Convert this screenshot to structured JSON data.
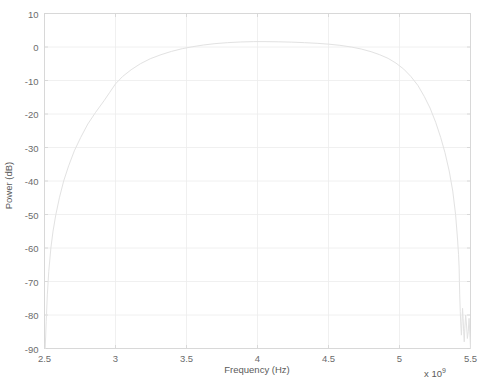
{
  "chart_data": {
    "type": "line",
    "title": "",
    "xlabel": "Frequency (Hz)",
    "ylabel": "Power (dB)",
    "x_exponent_prefix": "x 10",
    "x_exponent_value": "9",
    "xlim": [
      2.5,
      5.5
    ],
    "ylim": [
      -90,
      10
    ],
    "xticks": [
      2.5,
      3,
      3.5,
      4,
      4.5,
      5,
      5.5
    ],
    "xtick_labels": [
      "2.5",
      "3",
      "3.5",
      "4",
      "4.5",
      "5",
      "5.5"
    ],
    "yticks": [
      10,
      0,
      -10,
      -20,
      -30,
      -40,
      -50,
      -60,
      -70,
      -80,
      -90
    ],
    "ytick_labels": [
      "10",
      "0",
      "-10",
      "-20",
      "-30",
      "-40",
      "-50",
      "-60",
      "-70",
      "-80",
      "-90"
    ],
    "grid": true,
    "legend": null,
    "line_color": "#e2e2e2",
    "grid_color": "#ececec",
    "axis_color": "#d6d6d6",
    "background_color": "#ffffff",
    "series": [
      {
        "name": "power-spectrum",
        "x": [
          2.505,
          2.512,
          2.52,
          2.53,
          2.545,
          2.56,
          2.58,
          2.605,
          2.635,
          2.67,
          2.71,
          2.755,
          2.805,
          2.86,
          2.92,
          2.96,
          3.0,
          3.05,
          3.11,
          3.175,
          3.245,
          3.32,
          3.395,
          3.47,
          3.545,
          3.62,
          3.7,
          3.79,
          3.88,
          3.97,
          4.06,
          4.15,
          4.24,
          4.33,
          4.42,
          4.5,
          4.58,
          4.66,
          4.73,
          4.8,
          4.86,
          4.92,
          4.975,
          5.03,
          5.08,
          5.13,
          5.175,
          5.215,
          5.255,
          5.29,
          5.32,
          5.35,
          5.375,
          5.395,
          5.408,
          5.416,
          5.42,
          5.422,
          5.424,
          5.428,
          5.432,
          5.436,
          5.44,
          5.444,
          5.448,
          5.452,
          5.456,
          5.46,
          5.466,
          5.472,
          5.478,
          5.484,
          5.49,
          5.496,
          5.5
        ],
        "y": [
          -90.0,
          -82.0,
          -74.0,
          -67.0,
          -60.0,
          -55.0,
          -50.0,
          -45.0,
          -40.0,
          -35.5,
          -31.0,
          -27.0,
          -23.0,
          -19.5,
          -16.0,
          -13.5,
          -11.0,
          -8.8,
          -6.8,
          -5.0,
          -3.5,
          -2.3,
          -1.3,
          -0.5,
          0.1,
          0.6,
          1.0,
          1.3,
          1.5,
          1.6,
          1.6,
          1.55,
          1.45,
          1.3,
          1.1,
          0.85,
          0.5,
          0.0,
          -0.6,
          -1.4,
          -2.3,
          -3.4,
          -4.8,
          -6.6,
          -8.8,
          -11.5,
          -14.8,
          -18.2,
          -22.5,
          -27.0,
          -31.5,
          -37.0,
          -43.0,
          -50.0,
          -57.0,
          -62.0,
          -66.0,
          -70.0,
          -74.0,
          -79.0,
          -83.0,
          -86.0,
          -82.0,
          -78.0,
          -81.0,
          -85.0,
          -88.0,
          -84.0,
          -80.0,
          -83.0,
          -87.0,
          -85.0,
          -81.0,
          -86.0,
          -90.0
        ]
      }
    ]
  },
  "axes": {
    "x_label": "Frequency (Hz)",
    "y_label": "Power (dB)",
    "exponent_prefix": "x 10",
    "exponent_power": "9"
  }
}
